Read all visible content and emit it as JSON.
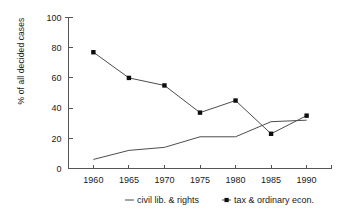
{
  "chart_data": {
    "type": "line",
    "title": "",
    "xlabel": "",
    "ylabel": "% of all decided cases",
    "x": [
      1960,
      1965,
      1970,
      1975,
      1980,
      1985,
      1990
    ],
    "xtick_labels": [
      "1960",
      "1965",
      "1970",
      "1975",
      "1980",
      "1985",
      "1990"
    ],
    "ytick_labels": [
      "0",
      "20",
      "40",
      "60",
      "80",
      "100"
    ],
    "yticks": [
      0,
      20,
      40,
      60,
      80,
      100
    ],
    "xlim": [
      1956.5,
      1993.5
    ],
    "ylim": [
      0,
      100
    ],
    "grid": false,
    "legend_position": "bottom",
    "series": [
      {
        "name": "civil lib. & rights",
        "marker": "none",
        "values": [
          6,
          12,
          14,
          21,
          21,
          31,
          32
        ]
      },
      {
        "name": "tax & ordinary econ.",
        "marker": "square",
        "values": [
          77,
          60,
          55,
          37,
          45,
          23,
          35
        ]
      }
    ]
  },
  "legend": {
    "items": [
      {
        "label": "civil lib. & rights",
        "marker": "line"
      },
      {
        "label": "tax & ordinary econ.",
        "marker": "line-dot"
      }
    ]
  },
  "colors": {
    "axis": "#555555",
    "series_line": "#4d4d4d",
    "marker": "#0d0d0d",
    "text": "#1a1a1a",
    "background": "#ffffff"
  }
}
